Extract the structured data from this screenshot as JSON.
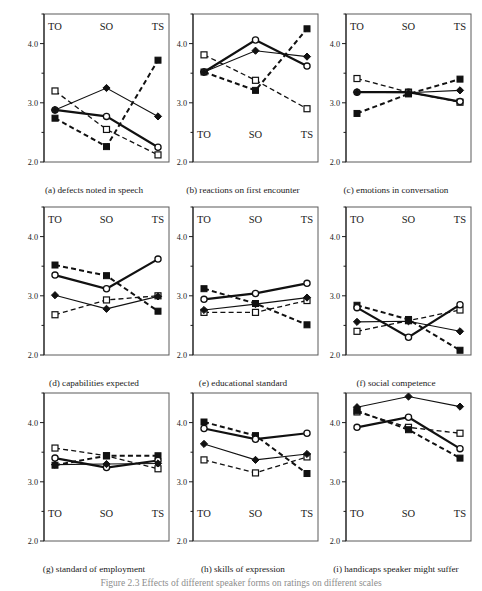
{
  "figure": {
    "caption": "Figure 2.3  Effects of different speaker forms on ratings on different scales",
    "y_axis": {
      "min": 2.0,
      "max": 4.5,
      "major_ticks": [
        2.0,
        3.0,
        4.0
      ],
      "major_tick_labels": [
        "2.0",
        "3.0",
        "4.0"
      ],
      "minor_ticks": [
        2.5,
        3.5,
        4.5
      ]
    },
    "x_categories": [
      "TO",
      "SO",
      "TS"
    ],
    "series_styles": [
      {
        "name": "open-square-dashed",
        "marker": "open-square",
        "line": "dashed",
        "width": 1.3
      },
      {
        "name": "filled-square-dashed",
        "marker": "filled-square",
        "line": "dashed",
        "width": 2.0
      },
      {
        "name": "open-circle-solid",
        "marker": "open-circle",
        "line": "solid",
        "width": 2.2
      },
      {
        "name": "filled-diamond-solid",
        "marker": "filled-diamond",
        "line": "solid",
        "width": 1.1
      }
    ]
  },
  "chart_data": [
    {
      "id": "a",
      "type": "line",
      "title": "(a) defects noted in speech",
      "label_position": "top",
      "categories": [
        "TO",
        "SO",
        "TS"
      ],
      "xlabel": "",
      "ylabel": "",
      "ylim": [
        2.0,
        4.5
      ],
      "grid": false,
      "legend": "none",
      "series": [
        {
          "name": "open-square-dashed",
          "values": [
            3.2,
            2.55,
            2.12
          ]
        },
        {
          "name": "filled-square-dashed",
          "values": [
            2.74,
            2.26,
            3.72
          ]
        },
        {
          "name": "open-circle-solid",
          "values": [
            2.88,
            2.77,
            2.25
          ]
        },
        {
          "name": "filled-diamond-solid",
          "values": [
            2.88,
            3.25,
            2.77
          ]
        }
      ]
    },
    {
      "id": "b",
      "type": "line",
      "title": "(b) reactions on first encounter",
      "label_position": "bottom",
      "categories": [
        "TO",
        "SO",
        "TS"
      ],
      "xlabel": "",
      "ylabel": "",
      "ylim": [
        2.0,
        4.5
      ],
      "grid": false,
      "legend": "none",
      "series": [
        {
          "name": "open-square-dashed",
          "values": [
            3.81,
            3.38,
            2.9
          ]
        },
        {
          "name": "filled-square-dashed",
          "values": [
            3.52,
            3.21,
            4.25
          ]
        },
        {
          "name": "open-circle-solid",
          "values": [
            3.52,
            4.06,
            3.62
          ]
        },
        {
          "name": "filled-diamond-solid",
          "values": [
            3.52,
            3.88,
            3.78
          ]
        }
      ]
    },
    {
      "id": "c",
      "type": "line",
      "title": "(c) emotions in conversation",
      "label_position": "top",
      "categories": [
        "TO",
        "SO",
        "TS"
      ],
      "xlabel": "",
      "ylabel": "",
      "ylim": [
        2.0,
        4.5
      ],
      "grid": false,
      "legend": "none",
      "series": [
        {
          "name": "open-square-dashed",
          "values": [
            3.41,
            3.18,
            3.01
          ]
        },
        {
          "name": "filled-square-dashed",
          "values": [
            2.82,
            3.15,
            3.4
          ]
        },
        {
          "name": "open-circle-solid",
          "values": [
            3.18,
            3.18,
            3.02
          ]
        },
        {
          "name": "filled-diamond-solid",
          "values": [
            3.18,
            3.17,
            3.21
          ]
        }
      ]
    },
    {
      "id": "d",
      "type": "line",
      "title": "(d) capabilities expected",
      "label_position": "top",
      "categories": [
        "TO",
        "SO",
        "TS"
      ],
      "xlabel": "",
      "ylabel": "",
      "ylim": [
        2.0,
        4.5
      ],
      "grid": false,
      "legend": "none",
      "series": [
        {
          "name": "open-square-dashed",
          "values": [
            2.68,
            2.93,
            3.0
          ]
        },
        {
          "name": "filled-square-dashed",
          "values": [
            3.52,
            3.34,
            2.74
          ]
        },
        {
          "name": "open-circle-solid",
          "values": [
            3.35,
            3.12,
            3.62
          ]
        },
        {
          "name": "filled-diamond-solid",
          "values": [
            3.01,
            2.78,
            2.99
          ]
        }
      ]
    },
    {
      "id": "e",
      "type": "line",
      "title": "(e) educational standard",
      "label_position": "top",
      "categories": [
        "TO",
        "SO",
        "TS"
      ],
      "xlabel": "",
      "ylabel": "",
      "ylim": [
        2.0,
        4.5
      ],
      "grid": false,
      "legend": "none",
      "series": [
        {
          "name": "open-square-dashed",
          "values": [
            2.72,
            2.72,
            2.92
          ]
        },
        {
          "name": "filled-square-dashed",
          "values": [
            3.12,
            2.87,
            2.51
          ]
        },
        {
          "name": "open-circle-solid",
          "values": [
            2.94,
            3.04,
            3.21
          ]
        },
        {
          "name": "filled-diamond-solid",
          "values": [
            2.76,
            2.86,
            2.97
          ]
        }
      ]
    },
    {
      "id": "f",
      "type": "line",
      "title": "(f) social competence",
      "label_position": "top",
      "categories": [
        "TO",
        "SO",
        "TS"
      ],
      "xlabel": "",
      "ylabel": "",
      "ylim": [
        2.0,
        4.5
      ],
      "grid": false,
      "legend": "none",
      "series": [
        {
          "name": "open-square-dashed",
          "values": [
            2.4,
            2.58,
            2.76
          ]
        },
        {
          "name": "filled-square-dashed",
          "values": [
            2.84,
            2.6,
            2.08
          ]
        },
        {
          "name": "open-circle-solid",
          "values": [
            2.8,
            2.3,
            2.85
          ]
        },
        {
          "name": "filled-diamond-solid",
          "values": [
            2.56,
            2.57,
            2.4
          ]
        }
      ]
    },
    {
      "id": "g",
      "type": "line",
      "title": "(g) standard of employment",
      "label_position": "bottom",
      "categories": [
        "TO",
        "SO",
        "TS"
      ],
      "xlabel": "",
      "ylabel": "",
      "ylim": [
        2.0,
        4.5
      ],
      "grid": false,
      "legend": "none",
      "series": [
        {
          "name": "open-square-dashed",
          "values": [
            3.57,
            3.44,
            3.22
          ]
        },
        {
          "name": "filled-square-dashed",
          "values": [
            3.28,
            3.44,
            3.44
          ]
        },
        {
          "name": "open-circle-solid",
          "values": [
            3.4,
            3.24,
            3.36
          ]
        },
        {
          "name": "filled-diamond-solid",
          "values": [
            3.29,
            3.3,
            3.31
          ]
        }
      ]
    },
    {
      "id": "h",
      "type": "line",
      "title": "(h) skills of expression",
      "label_position": "bottom",
      "categories": [
        "TO",
        "SO",
        "TS"
      ],
      "xlabel": "",
      "ylabel": "",
      "ylim": [
        2.0,
        4.5
      ],
      "grid": false,
      "legend": "none",
      "series": [
        {
          "name": "open-square-dashed",
          "values": [
            3.37,
            3.15,
            3.42
          ]
        },
        {
          "name": "filled-square-dashed",
          "values": [
            4.01,
            3.78,
            3.14
          ]
        },
        {
          "name": "open-circle-solid",
          "values": [
            3.9,
            3.72,
            3.82
          ]
        },
        {
          "name": "filled-diamond-solid",
          "values": [
            3.64,
            3.37,
            3.47
          ]
        }
      ]
    },
    {
      "id": "i",
      "type": "line",
      "title": "(i) handicaps speaker might suffer",
      "label_position": "bottom",
      "categories": [
        "TO",
        "SO",
        "TS"
      ],
      "xlabel": "",
      "ylabel": "",
      "ylim": [
        2.0,
        4.5
      ],
      "grid": false,
      "legend": "none",
      "series": [
        {
          "name": "open-square-dashed",
          "values": [
            4.18,
            3.92,
            3.82
          ]
        },
        {
          "name": "filled-square-dashed",
          "values": [
            4.2,
            3.88,
            3.4
          ]
        },
        {
          "name": "open-circle-solid",
          "values": [
            3.92,
            4.09,
            3.56
          ]
        },
        {
          "name": "filled-diamond-solid",
          "values": [
            4.26,
            4.44,
            4.27
          ]
        }
      ]
    }
  ],
  "layout": {
    "panel_positions": [
      {
        "id": "a",
        "x": 14,
        "y": 6
      },
      {
        "id": "b",
        "x": 163,
        "y": 6
      },
      {
        "id": "c",
        "x": 316,
        "y": 6
      },
      {
        "id": "d",
        "x": 14,
        "y": 199
      },
      {
        "id": "e",
        "x": 163,
        "y": 199
      },
      {
        "id": "f",
        "x": 316,
        "y": 199
      },
      {
        "id": "g",
        "x": 14,
        "y": 385
      },
      {
        "id": "h",
        "x": 163,
        "y": 385
      },
      {
        "id": "i",
        "x": 316,
        "y": 385
      }
    ]
  }
}
